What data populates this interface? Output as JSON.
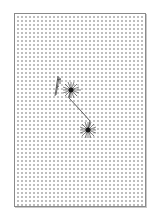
{
  "figure": {
    "background": "dot-grid",
    "border_color": "#8a8a8a",
    "dot_color": "#9a9a9a",
    "ink_color": "#2a2a2a"
  },
  "diagram": {
    "nodes": [
      {
        "id": "node-a",
        "x": 71,
        "y": 90,
        "type": "starburst"
      },
      {
        "id": "node-b",
        "x": 88,
        "y": 130,
        "type": "starburst"
      }
    ],
    "edges": [
      {
        "from": "node-a",
        "to": "node-b",
        "path": "bent-line"
      }
    ],
    "marks": [
      {
        "id": "pencil-sketch",
        "x": 58,
        "y": 80
      }
    ]
  },
  "caption": ""
}
